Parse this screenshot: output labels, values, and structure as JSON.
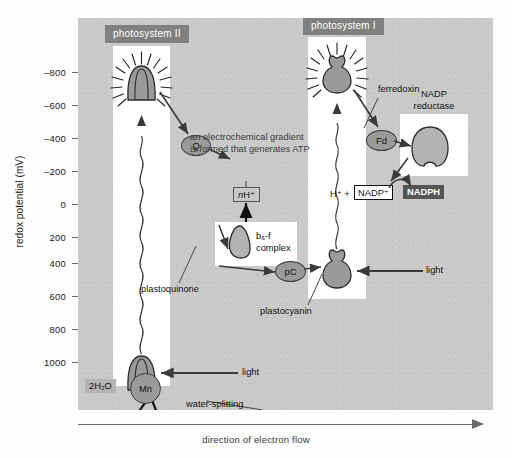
{
  "chart_data": {
    "type": "diagram",
    "ylabel": "redox potential (mV)",
    "xlabel": "direction of electron flow",
    "ylim": [
      -900,
      1150
    ],
    "ytick_labels": [
      "–800",
      "–600",
      "–400",
      "–200",
      "0",
      "200",
      "400",
      "600",
      "800",
      "1000"
    ],
    "ytick_values": [
      -800,
      -600,
      -400,
      -200,
      0,
      200,
      400,
      600,
      800,
      1000
    ],
    "grid": false,
    "legend": "none",
    "nodes": [
      {
        "name": "photosystem II reaction centre",
        "label": "photosystem II",
        "redox_excited": -200,
        "redox_ground": 1000
      },
      {
        "name": "plastoquinone",
        "label": "Q",
        "redox": 0
      },
      {
        "name": "b6-f complex",
        "label": "b₆-f complex",
        "redox": 250
      },
      {
        "name": "plastocyanin",
        "label": "pC",
        "redox": 400
      },
      {
        "name": "photosystem I reaction centre",
        "label": "photosystem I",
        "redox_excited": -700,
        "redox_ground": 480
      },
      {
        "name": "ferredoxin",
        "label": "Fd",
        "redox": -400
      },
      {
        "name": "NADP reductase",
        "label": "NADP reductase",
        "redox": -300
      }
    ],
    "annotations": [
      "an electrochemical gradient is formed that generates ATP",
      "water-splitting enzyme",
      "direction of electron flow"
    ]
  },
  "axis": {
    "y_title": "redox potential (mV)",
    "x_title": "direction of electron flow",
    "ticks": [
      {
        "label": "–800",
        "top": 72
      },
      {
        "label": "–600",
        "top": 105
      },
      {
        "label": "–400",
        "top": 138
      },
      {
        "label": "–200",
        "top": 171
      },
      {
        "label": "0",
        "top": 204
      },
      {
        "label": "200",
        "top": 237
      },
      {
        "label": "400",
        "top": 263
      },
      {
        "label": "600",
        "top": 296
      },
      {
        "label": "800",
        "top": 329
      },
      {
        "label": "1000",
        "top": 362
      }
    ]
  },
  "headers": {
    "psii": "photosystem II",
    "psi": "photosystem I"
  },
  "notes": {
    "gradient_line1": "an electrochemical gradient",
    "gradient_line2": "is formed that generates ATP",
    "water_line1": "water-splitting",
    "water_line2": "enzyme",
    "nadp_reductase_line1": "NADP",
    "nadp_reductase_line2": "reductase"
  },
  "labels": {
    "ferredoxin": "ferredoxin",
    "plastoquinone": "plastoquinone",
    "plastocyanin": "plastocyanin",
    "light_top": "light",
    "light_bottom": "light"
  },
  "nodes": {
    "q": "Q",
    "pc": "pC",
    "fd": "Fd",
    "mn": "Mn",
    "b6f_line1": "b₆-f",
    "b6f_line2": "complex"
  },
  "chem": {
    "nh": "nH⁺",
    "water": "2H₂O",
    "oxygen": "O₂ + 4H⁺",
    "hplus": "H⁺ +",
    "nadp_plus": "NADP⁺",
    "nadph": "NADPH"
  },
  "colors": {
    "plot_background": "#c9c9c9",
    "panel": "#ffffff",
    "header_band": "#808080",
    "complex_fill": "#9a9a9a",
    "complex_stroke": "#3a3a3a",
    "dark_badge": "#555555",
    "gray_badge": "#b4b4b4",
    "axis_line": "#6a6a6a",
    "text": "#111111"
  }
}
